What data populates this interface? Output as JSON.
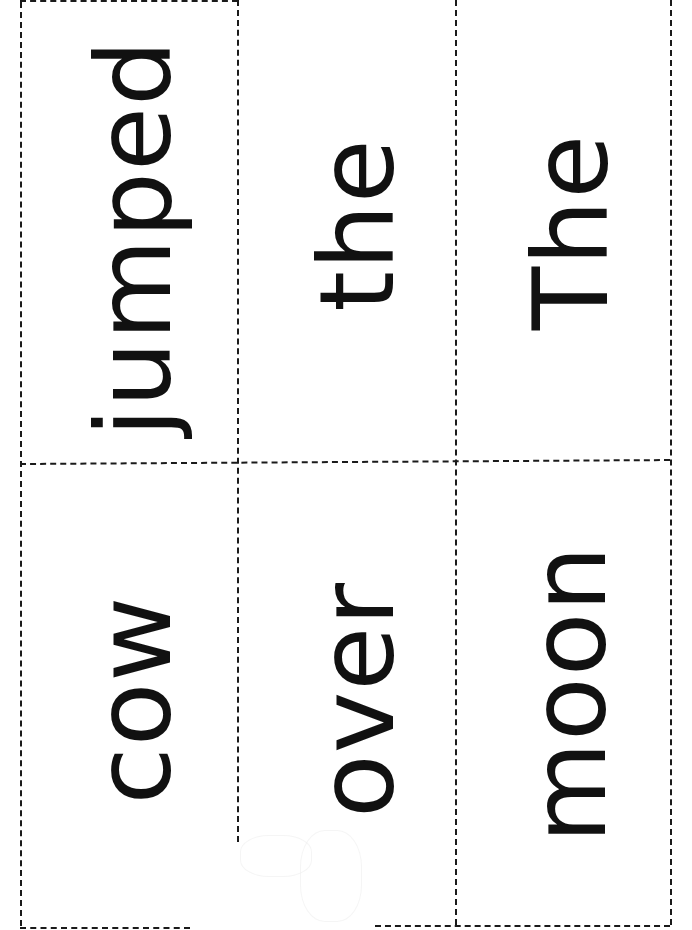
{
  "worksheet": {
    "background_color": "#ffffff",
    "cut_line_color": "#1a1a1a",
    "text_color": "#111111",
    "layout": {
      "columns": 3,
      "rows": 2,
      "orientation": "words rotated 90deg counter-clockwise"
    },
    "cards": [
      {
        "row": 1,
        "column": 1,
        "word": "jumped"
      },
      {
        "row": 1,
        "column": 2,
        "word": "the"
      },
      {
        "row": 1,
        "column": 3,
        "word": "The"
      },
      {
        "row": 2,
        "column": 1,
        "word": "cow"
      },
      {
        "row": 2,
        "column": 2,
        "word": "over"
      },
      {
        "row": 2,
        "column": 3,
        "word": "moon"
      }
    ]
  }
}
